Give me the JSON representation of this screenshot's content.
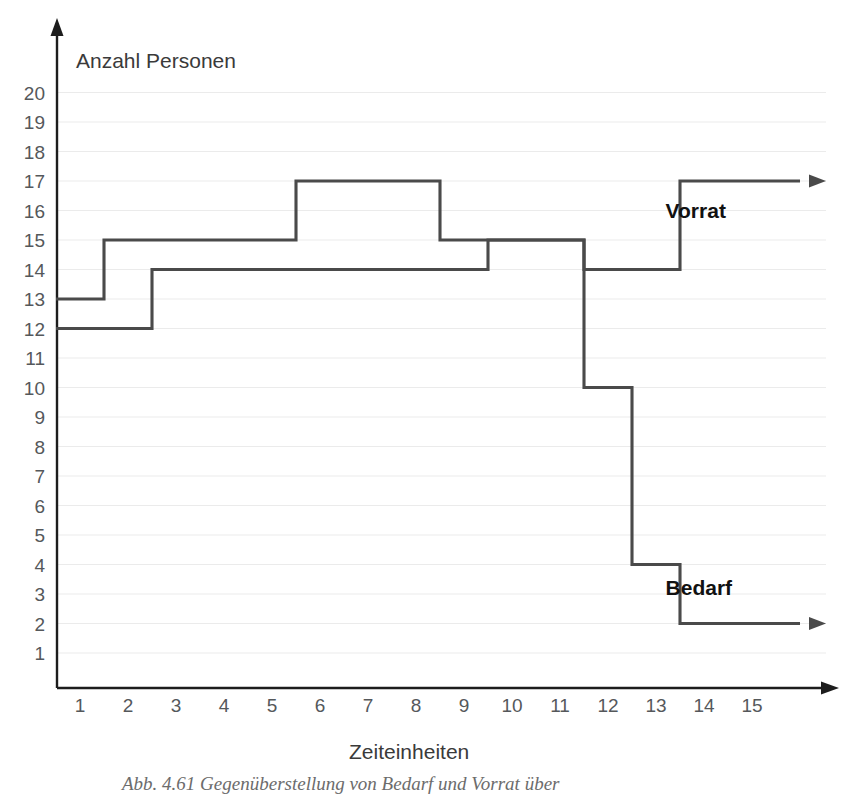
{
  "chart_data": {
    "type": "line",
    "title": "",
    "subtitle": "",
    "xlabel": "Zeiteinheiten",
    "ylabel": "Anzahl Personen",
    "xlim": [
      0,
      16
    ],
    "ylim": [
      0,
      21
    ],
    "grid": true,
    "grid_axis": "y",
    "legend_position": "inline-right",
    "step_type": "post",
    "x_ticks": [
      "1",
      "2",
      "3",
      "4",
      "5",
      "6",
      "7",
      "8",
      "9",
      "10",
      "11",
      "12",
      "13",
      "14",
      "15"
    ],
    "y_ticks": [
      "1",
      "2",
      "3",
      "4",
      "5",
      "6",
      "7",
      "8",
      "9",
      "10",
      "11",
      "12",
      "13",
      "14",
      "15",
      "16",
      "17",
      "18",
      "19",
      "20"
    ],
    "series": [
      {
        "name": "Vorrat",
        "label": "Vorrat",
        "color": "#4a4a4a",
        "steps": [
          {
            "from": 0.5,
            "to": 1.5,
            "value": 13
          },
          {
            "from": 1.5,
            "to": 5.5,
            "value": 15
          },
          {
            "from": 5.5,
            "to": 8.5,
            "value": 17
          },
          {
            "from": 8.5,
            "to": 11.5,
            "value": 15
          },
          {
            "from": 11.5,
            "to": 13.5,
            "value": 14
          },
          {
            "from": 13.5,
            "to": 16.0,
            "value": 17
          }
        ],
        "values_at_ticks": [
          13,
          15,
          15,
          15,
          15,
          17,
          17,
          17,
          15,
          15,
          15,
          14,
          14,
          17,
          17
        ],
        "arrow_end": true
      },
      {
        "name": "Bedarf",
        "label": "Bedarf",
        "color": "#4a4a4a",
        "steps": [
          {
            "from": 0.5,
            "to": 2.5,
            "value": 12
          },
          {
            "from": 2.5,
            "to": 9.5,
            "value": 14
          },
          {
            "from": 9.5,
            "to": 11.5,
            "value": 15
          },
          {
            "from": 11.5,
            "to": 12.5,
            "value": 10
          },
          {
            "from": 12.5,
            "to": 13.5,
            "value": 4
          },
          {
            "from": 13.5,
            "to": 16.0,
            "value": 2
          }
        ],
        "values_at_ticks": [
          12,
          12,
          14,
          14,
          14,
          14,
          14,
          14,
          14,
          15,
          15,
          10,
          4,
          2,
          2
        ],
        "arrow_end": true
      }
    ],
    "annotations": [
      {
        "text": "Vorrat",
        "x": 13.2,
        "y": 16.0
      },
      {
        "text": "Bedarf",
        "x": 13.2,
        "y": 3.2
      }
    ]
  },
  "axes": {
    "y_axis_title": "Anzahl Personen",
    "x_axis_title": "Zeiteinheiten"
  },
  "caption": {
    "text": "Abb. 4.61  Gegenüberstellung von Bedarf und Vorrat über"
  },
  "colors": {
    "line": "#4a4a4a",
    "axis": "#1d1d1d",
    "grid": "#ebebeb",
    "tick_text": "#55585b",
    "title_text": "#3a3a3a",
    "label_text": "#111111",
    "background": "#ffffff"
  }
}
